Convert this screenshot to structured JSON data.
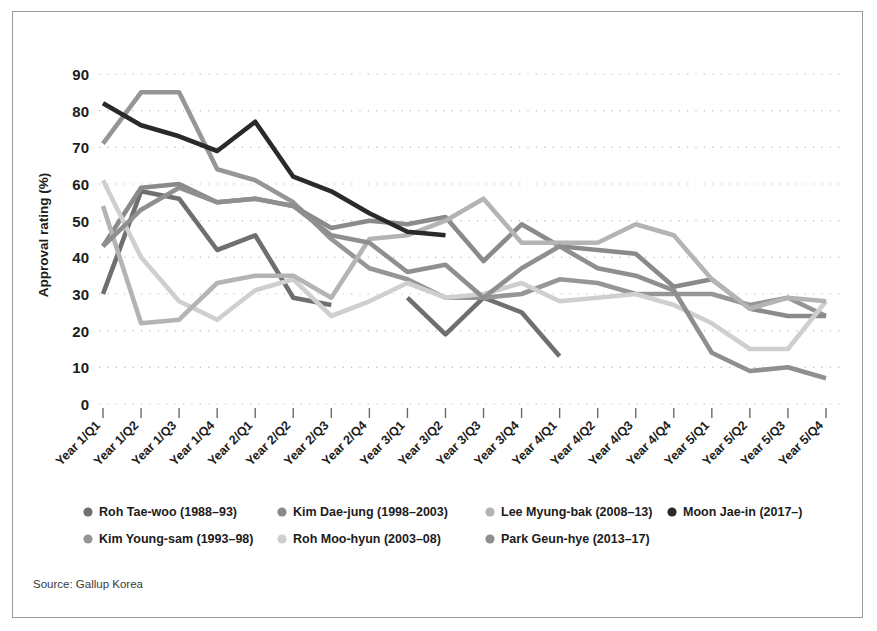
{
  "figure": {
    "source_note": "Source: Gallup Korea",
    "border_color": "#9a9a9a",
    "background": "#ffffff"
  },
  "chart_data": {
    "type": "line",
    "title": "",
    "subtitle": "",
    "xlabel": "",
    "ylabel": "Approval rating (%)",
    "ylim": [
      0,
      95
    ],
    "yticks": [
      0,
      10,
      20,
      30,
      40,
      50,
      60,
      70,
      80,
      90
    ],
    "ytick_labels": [
      "0",
      "10",
      "20",
      "30",
      "40",
      "50",
      "60",
      "70",
      "80",
      "90"
    ],
    "grid": true,
    "grid_style": "dotted-horizontal",
    "legend_position": "bottom",
    "categories": [
      "Year 1/Q1",
      "Year 1/Q2",
      "Year 1/Q3",
      "Year 1/Q4",
      "Year 2/Q1",
      "Year 2/Q2",
      "Year 2/Q3",
      "Year 2/Q4",
      "Year 3/Q1",
      "Year 3/Q2",
      "Year 3/Q3",
      "Year 3/Q4",
      "Year 4/Q1",
      "Year 4/Q2",
      "Year 4/Q3",
      "Year 4/Q4",
      "Year 5/Q1",
      "Year 5/Q2",
      "Year 5/Q3",
      "Year 5/Q4"
    ],
    "series": [
      {
        "name": "Roh Tae-woo (1988–93)",
        "color": "#6f6f6f",
        "values": [
          30,
          58,
          56,
          42,
          46,
          29,
          27,
          null,
          29,
          19,
          29,
          25,
          13,
          null,
          null,
          null,
          null,
          null,
          null,
          null
        ]
      },
      {
        "name": "Kim Young-sam (1993–98)",
        "color": "#969696",
        "values": [
          71,
          85,
          85,
          64,
          61,
          55,
          45,
          37,
          34,
          29,
          29,
          30,
          34,
          33,
          30,
          30,
          30,
          27,
          29,
          24
        ]
      },
      {
        "name": "Kim Dae-jung (1998–2003)",
        "color": "#8a8a8a",
        "values": [
          43,
          59,
          60,
          55,
          56,
          54,
          48,
          50,
          49,
          51,
          39,
          49,
          43,
          42,
          41,
          32,
          34,
          26,
          24,
          24
        ]
      },
      {
        "name": "Roh Moo-hyun (2003–08)",
        "color": "#cfcfcf",
        "values": [
          61,
          40,
          28,
          23,
          31,
          34,
          24,
          28,
          33,
          29,
          30,
          33,
          28,
          29,
          30,
          27,
          22,
          15,
          15,
          28
        ]
      },
      {
        "name": "Lee Myung-bak (2008–13)",
        "color": "#b4b4b4",
        "values": [
          54,
          22,
          23,
          33,
          35,
          35,
          29,
          45,
          46,
          50,
          56,
          44,
          44,
          44,
          49,
          46,
          34,
          26,
          29,
          28
        ]
      },
      {
        "name": "Park Geun-hye (2013–17)",
        "color": "#8f8f8f",
        "values": [
          43,
          53,
          59,
          55,
          56,
          54,
          46,
          44,
          36,
          38,
          29,
          37,
          43,
          37,
          35,
          31,
          14,
          9,
          10,
          7
        ]
      },
      {
        "name": "Moon Jae-in (2017–)",
        "color": "#2a2a2a",
        "values": [
          82,
          76,
          73,
          69,
          77,
          62,
          58,
          52,
          47,
          46,
          null,
          null,
          null,
          null,
          null,
          null,
          null,
          null,
          null,
          null
        ]
      }
    ],
    "legend": [
      {
        "label": "Roh Tae-woo (1988–93)",
        "color": "#6f6f6f"
      },
      {
        "label": "Kim Dae-jung (1998–2003)",
        "color": "#8a8a8a"
      },
      {
        "label": "Lee Myung-bak (2008–13)",
        "color": "#b4b4b4"
      },
      {
        "label": "Moon Jae-in (2017–)",
        "color": "#2a2a2a"
      },
      {
        "label": "Kim Young-sam (1993–98)",
        "color": "#969696"
      },
      {
        "label": "Roh Moo-hyun (2003–08)",
        "color": "#cfcfcf"
      },
      {
        "label": "Park Geun-hye (2013–17)",
        "color": "#8f8f8f"
      }
    ]
  }
}
